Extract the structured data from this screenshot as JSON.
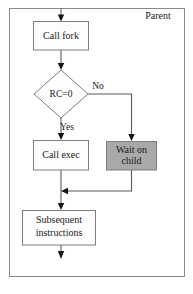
{
  "diagram": {
    "frame": {
      "label": "Parent"
    },
    "nodes": [
      {
        "id": "call-fork",
        "label": "Call fork",
        "shape": "process",
        "fill": "#fdfdfd"
      },
      {
        "id": "rc-check",
        "label": "RC=0",
        "shape": "decision",
        "fill": "#fdfdfd"
      },
      {
        "id": "call-exec",
        "label": "Call exec",
        "shape": "process",
        "fill": "#fdfdfd"
      },
      {
        "id": "wait-child",
        "label_line1": "Wait on",
        "label_line2": "child",
        "shape": "process",
        "fill": "#a9a9a9"
      },
      {
        "id": "subsequent",
        "label_line1": "Subsequent",
        "label_line2": "instructions",
        "shape": "process",
        "fill": "#fdfdfd"
      }
    ],
    "branch_labels": {
      "yes": "Yes",
      "no": "No"
    },
    "colors": {
      "line": "#5a5a5a",
      "arrow": "#151515",
      "outline": "#7d7d7d",
      "shaded_fill": "#a9a9a9",
      "plain_fill": "#fdfdfd",
      "frame_stroke": "#8a8a8a",
      "text": "#1a1a1a",
      "background": "#ffffff"
    }
  }
}
